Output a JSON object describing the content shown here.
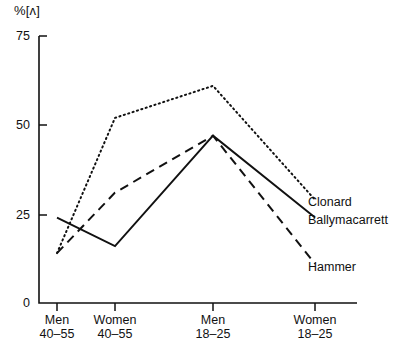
{
  "chart_data": {
    "type": "line",
    "title": "",
    "subtitle": "",
    "xlabel": "",
    "ylabel": "%[ʌ]",
    "ylim": [
      0,
      75
    ],
    "yticks": [
      0,
      25,
      50,
      75
    ],
    "ytick_labels": [
      "0",
      "25",
      "50",
      "75"
    ],
    "grid": false,
    "legend_position": "right-inline-at-line-ends",
    "categories": [
      "Men 40-55",
      "Women 40-55",
      "Men 18-25",
      "Women 18-25"
    ],
    "category_lines": [
      {
        "line1": "Men",
        "line2": "40–55"
      },
      {
        "line1": "Women",
        "line2": "40–55"
      },
      {
        "line1": "Men",
        "line2": "18–25"
      },
      {
        "line1": "Women",
        "line2": "18–25"
      }
    ],
    "series": [
      {
        "name": "Clonard",
        "style": "dotted",
        "color": "#111111",
        "values": [
          14,
          52,
          61,
          29
        ]
      },
      {
        "name": "Ballymacarrett",
        "style": "solid",
        "color": "#111111",
        "values": [
          24,
          16,
          47,
          24
        ]
      },
      {
        "name": "Hammer",
        "style": "dashed",
        "color": "#111111",
        "values": [
          14,
          31,
          47,
          11
        ]
      }
    ]
  },
  "axis": {
    "unit_label": "%[ʌ]",
    "y_labels": [
      "75",
      "50",
      "25",
      "0"
    ]
  },
  "legend": {
    "items": [
      {
        "label": "Clonard"
      },
      {
        "label": "Ballymacarrett"
      },
      {
        "label": "Hammer"
      }
    ]
  }
}
